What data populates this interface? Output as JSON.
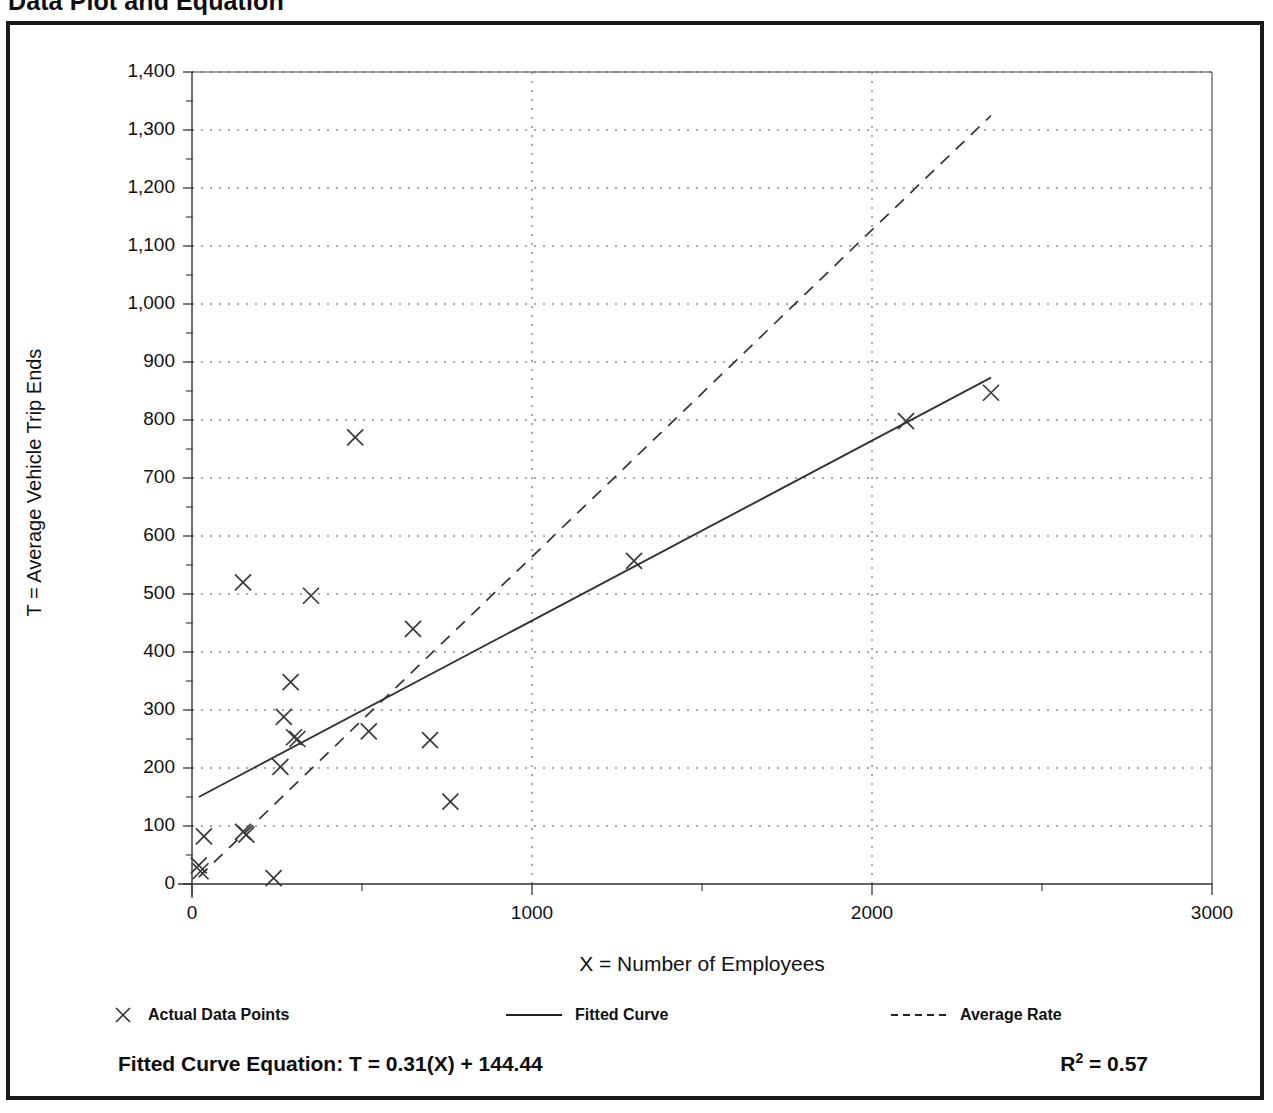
{
  "page_title": "Data Plot and Equation",
  "axes": {
    "y_title": "T = Average Vehicle Trip Ends",
    "x_title": "X = Number of Employees"
  },
  "legend": {
    "items": [
      {
        "label": "Actual Data Points",
        "mark": "marker-x"
      },
      {
        "label": "Fitted Curve",
        "mark": "solid-line"
      },
      {
        "label": "Average Rate",
        "mark": "dashed-line"
      }
    ]
  },
  "equation": {
    "fitted_curve_label": "Fitted Curve Equation:  T = 0.31(X) + 144.44",
    "r_squared_prefix": "R",
    "r_squared_sup": "2",
    "r_squared_value": " = 0.57"
  },
  "chart_data": {
    "type": "scatter",
    "title": "Data Plot and Equation",
    "xlabel": "X = Number of Employees",
    "ylabel": "T = Average Vehicle Trip Ends",
    "xlim": [
      0,
      3000
    ],
    "ylim": [
      0,
      1400
    ],
    "xticks": [
      0,
      1000,
      2000,
      3000
    ],
    "xtick_labels": [
      "0",
      "1000",
      "2000",
      "3000"
    ],
    "x_minor_tick_interval": 500,
    "yticks": [
      0,
      100,
      200,
      300,
      400,
      500,
      600,
      700,
      800,
      900,
      1000,
      1100,
      1200,
      1300,
      1400
    ],
    "ytick_labels": [
      "0",
      "100",
      "200",
      "300",
      "400",
      "500",
      "600",
      "700",
      "800",
      "900",
      "1,000",
      "1,100",
      "1,200",
      "1,300",
      "1,400"
    ],
    "y_minor_tick_interval": 50,
    "grid": "dotted-horizontal-and-vertical",
    "legend_position": "below-plot",
    "series": [
      {
        "name": "Actual Data Points",
        "type": "scatter",
        "marker": "x",
        "points": [
          [
            25,
            22
          ],
          [
            20,
            32
          ],
          [
            35,
            82
          ],
          [
            150,
            90
          ],
          [
            160,
            85
          ],
          [
            150,
            520
          ],
          [
            240,
            10
          ],
          [
            260,
            202
          ],
          [
            270,
            288
          ],
          [
            290,
            348
          ],
          [
            300,
            253
          ],
          [
            310,
            250
          ],
          [
            350,
            497
          ],
          [
            480,
            770
          ],
          [
            520,
            263
          ],
          [
            650,
            440
          ],
          [
            700,
            248
          ],
          [
            760,
            142
          ],
          [
            1300,
            557
          ],
          [
            2100,
            798
          ],
          [
            2350,
            847
          ]
        ]
      },
      {
        "name": "Fitted Curve",
        "type": "line",
        "style": "solid",
        "equation": "T = 0.31(X) + 144.44",
        "slope": 0.31,
        "intercept": 144.44,
        "r_squared": 0.57,
        "endpoints": [
          [
            20,
            150
          ],
          [
            2350,
            873
          ]
        ]
      },
      {
        "name": "Average Rate",
        "type": "line",
        "style": "dashed",
        "endpoints": [
          [
            20,
            12
          ],
          [
            2350,
            1325
          ]
        ]
      }
    ]
  }
}
